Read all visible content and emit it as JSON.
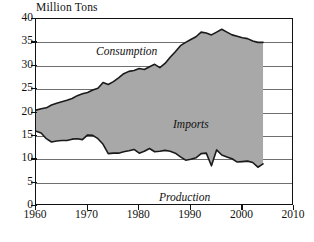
{
  "chart_data": {
    "type": "area",
    "title": "Million Tons",
    "xlabel": "",
    "ylabel": "Million Tons",
    "xlim": [
      1960,
      2010
    ],
    "ylim": [
      0,
      40
    ],
    "grid": true,
    "legend_position": "inline-annotations",
    "xticks": [
      1960,
      1970,
      1980,
      1990,
      2000,
      2010
    ],
    "yticks": [
      0,
      5,
      10,
      15,
      20,
      25,
      30,
      35,
      40
    ],
    "annotations": [
      {
        "text": "Consumption",
        "x": 1968,
        "y": 38
      },
      {
        "text": "Imports",
        "x": 1985,
        "y": 22
      },
      {
        "text": "Production",
        "x": 1982,
        "y": 6.5
      },
      {
        "text": "Source: USDA",
        "x": 2000,
        "y": 2
      }
    ],
    "source_note": "Source: USDA",
    "colors": {
      "imports_fill": "#a8a8a8",
      "line": "#1a1a1a",
      "grid": "#6f6f6f",
      "frame": "#111111",
      "background": "#ffffff"
    },
    "x": [
      1960,
      1961,
      1962,
      1963,
      1964,
      1965,
      1966,
      1967,
      1968,
      1969,
      1970,
      1971,
      1972,
      1973,
      1974,
      1975,
      1976,
      1977,
      1978,
      1979,
      1980,
      1981,
      1982,
      1983,
      1984,
      1985,
      1986,
      1987,
      1988,
      1989,
      1990,
      1991,
      1992,
      1993,
      1994,
      1995,
      1996,
      1997,
      1998,
      1999,
      2000,
      2001,
      2002,
      2003,
      2004
    ],
    "series": [
      {
        "name": "Consumption",
        "values": [
          20.5,
          20.8,
          21.0,
          21.6,
          22.0,
          22.3,
          22.6,
          23.0,
          23.6,
          24.0,
          24.3,
          24.8,
          25.2,
          26.4,
          26.0,
          26.6,
          27.4,
          28.3,
          28.8,
          29.0,
          29.4,
          29.2,
          29.8,
          30.3,
          29.6,
          30.5,
          31.8,
          33.0,
          34.3,
          35.0,
          35.6,
          36.2,
          37.2,
          37.0,
          36.6,
          37.2,
          37.8,
          37.2,
          36.6,
          36.3,
          36.0,
          35.8,
          35.3,
          35.0,
          35.0
        ]
      },
      {
        "name": "Production",
        "values": [
          16.0,
          15.6,
          14.4,
          13.7,
          13.9,
          14.0,
          14.0,
          14.3,
          14.4,
          14.2,
          15.2,
          15.1,
          14.4,
          13.2,
          11.2,
          11.3,
          11.3,
          11.6,
          11.8,
          12.1,
          11.3,
          11.7,
          12.3,
          11.6,
          11.7,
          11.9,
          11.7,
          11.3,
          10.5,
          9.8,
          10.0,
          10.3,
          11.2,
          11.3,
          8.6,
          12.0,
          10.9,
          10.5,
          10.1,
          9.4,
          9.5,
          9.6,
          9.3,
          8.3,
          9.0
        ]
      }
    ],
    "derived_series": [
      {
        "name": "Imports",
        "description": "Shaded band between Production (lower) and Consumption (upper)"
      }
    ]
  },
  "labels": {
    "axis_title": "Million Tons",
    "consumption": "Consumption",
    "imports": "Imports",
    "production": "Production",
    "source": "Source: USDA"
  }
}
